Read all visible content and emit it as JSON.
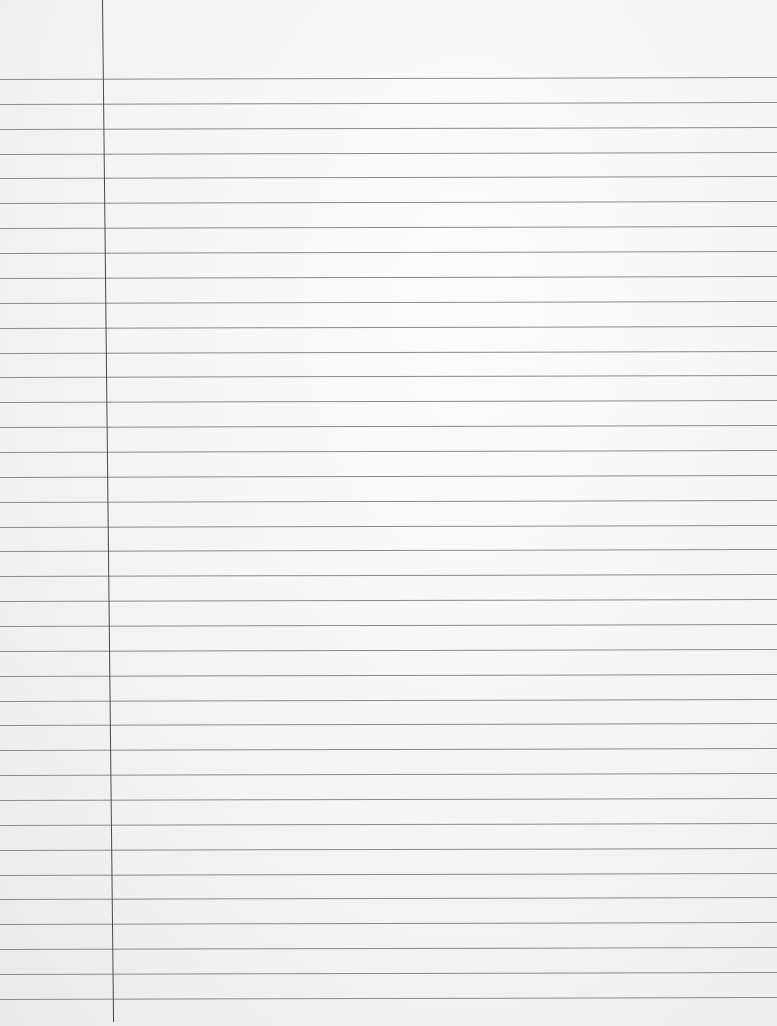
{
  "paper": {
    "type": "lined-notebook-paper",
    "background_color": "#f4f4f4",
    "rule_color": "#8a8a8a",
    "margin_color": "#4a4a4a",
    "first_rule_y": 79,
    "rule_spacing": 24.86,
    "rule_count": 38,
    "margin_x_top": 102,
    "margin_x_bottom": 113,
    "margin_end_y": 1022
  }
}
